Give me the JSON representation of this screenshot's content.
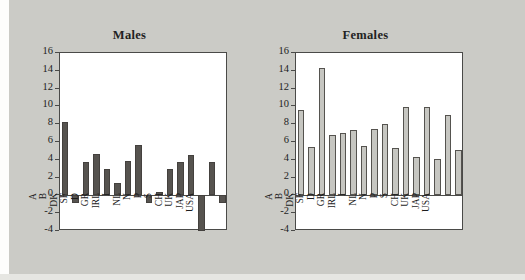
{
  "figure": {
    "background_color": "#c9c9c4",
    "panels": [
      {
        "id": "males",
        "title": "Males"
      },
      {
        "id": "females",
        "title": "Females"
      }
    ]
  },
  "axis": {
    "y_ticks": [
      "16",
      "14",
      "12",
      "10",
      "8",
      "6",
      "4",
      "2",
      "0",
      "-2",
      "-4"
    ],
    "y_min": -4,
    "y_max": 16
  },
  "chart_data": [
    {
      "type": "bar",
      "title": "Males",
      "xlabel": "",
      "ylabel": "",
      "ylim": [
        -4,
        16
      ],
      "yticks": [
        -4,
        -2,
        0,
        2,
        4,
        6,
        8,
        10,
        12,
        14,
        16
      ],
      "grid": false,
      "legend": null,
      "bar_color": "#56534f",
      "bar_edge_color": "#44413e",
      "categories": [
        "A",
        "B",
        "DK",
        "SF",
        "D",
        "GR",
        "IRL",
        "I",
        "NL",
        "N",
        "P",
        "S",
        "CH",
        "UK",
        "JAP",
        "USA"
      ],
      "values": [
        8.2,
        -0.8,
        3.7,
        4.7,
        3.0,
        1.4,
        3.9,
        5.7,
        -0.8,
        0.4,
        3.0,
        3.7,
        4.5,
        -4.0,
        3.8,
        -0.8
      ]
    },
    {
      "type": "bar",
      "title": "Females",
      "xlabel": "",
      "ylabel": "",
      "ylim": [
        -4,
        16
      ],
      "yticks": [
        -4,
        -2,
        0,
        2,
        4,
        6,
        8,
        10,
        12,
        14,
        16
      ],
      "grid": false,
      "legend": null,
      "bar_color": "#c6c6c1",
      "bar_edge_color": "#55534f",
      "categories": [
        "A",
        "B",
        "DK",
        "SF",
        "D",
        "GR",
        "IRL",
        "I",
        "NL",
        "N",
        "P",
        "S",
        "CH",
        "UK",
        "JAP",
        "USA"
      ],
      "values": [
        9.6,
        5.4,
        14.3,
        6.8,
        7.0,
        7.4,
        5.6,
        7.5,
        8.0,
        5.3,
        9.9,
        4.3,
        9.9,
        4.1,
        9.0,
        5.1
      ]
    }
  ]
}
